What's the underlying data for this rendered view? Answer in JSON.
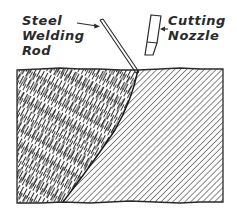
{
  "diagram": {
    "type": "technical-illustration",
    "labels": {
      "rod": {
        "lines": [
          "Steel",
          "Welding",
          "Rod"
        ]
      },
      "nozzle": {
        "lines": [
          "Cutting",
          "Nozzle"
        ]
      }
    },
    "colors": {
      "ink": "#2a2a2a",
      "background": "#ffffff"
    },
    "regions": [
      {
        "name": "weld-deposit",
        "hatch": "dense irregular diagonal dashes"
      },
      {
        "name": "base-metal",
        "hatch": "regular diagonal lines"
      }
    ]
  }
}
